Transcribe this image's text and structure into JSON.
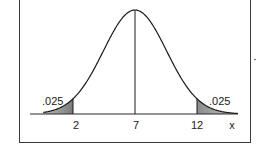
{
  "chart_data": {
    "type": "area",
    "title": "",
    "xlabel": "x",
    "ylabel": "",
    "distribution": "normal",
    "mean": 7,
    "std_dev": 2.55,
    "x_ticks": [
      2,
      7,
      12
    ],
    "x_tick_labels": [
      "2",
      "7",
      "12"
    ],
    "x_axis_label": "x",
    "shaded_regions": [
      {
        "name": "left-tail",
        "from": null,
        "to": 2,
        "area_label": ".025",
        "area": 0.025
      },
      {
        "name": "right-tail",
        "from": 12,
        "to": null,
        "area_label": ".025",
        "area": 0.025
      }
    ],
    "vertical_lines": [
      {
        "x": 2,
        "range": "baseline-to-curve"
      },
      {
        "x": 7,
        "range": "baseline-to-peak"
      },
      {
        "x": 12,
        "range": "baseline-to-curve"
      }
    ],
    "grid": false,
    "legend": null,
    "xlim": [
      -0.4,
      15.3
    ]
  },
  "labels": {
    "left_area": ".025",
    "right_area": ".025",
    "tick_2": "2",
    "tick_7": "7",
    "tick_12": "12",
    "x_axis": "x"
  },
  "colors": {
    "curve": "#1a1a1a",
    "shade": "#9a9a9a",
    "shade_dark": "#6e6e6e",
    "frame": "#3a3a3a"
  }
}
